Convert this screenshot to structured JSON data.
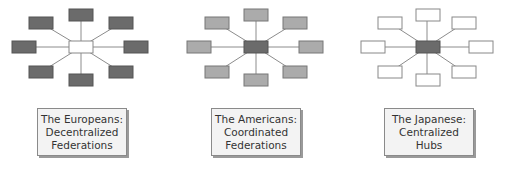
{
  "diagrams": [
    {
      "title_lines": [
        "The Europeans:",
        "Decentralized",
        "Federations"
      ],
      "hub_fill": "#ffffff",
      "node_fill": "#6b6b6b",
      "offset_x": 0
    },
    {
      "title_lines": [
        "The Americans:",
        "Coordinated",
        "Federations"
      ],
      "hub_fill": "#6b6b6b",
      "node_fill": "#ababab",
      "offset_x": 176
    },
    {
      "title_lines": [
        "The Japanese:",
        "Centralized",
        "Hubs"
      ],
      "hub_fill": "#6b6b6b",
      "node_fill": "#ffffff",
      "offset_x": 348
    }
  ],
  "colors": {
    "stroke": "#7a7a7a",
    "line": "#8c8c8c"
  }
}
